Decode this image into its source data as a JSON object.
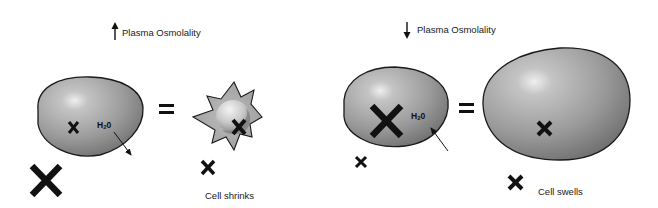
{
  "panels": [
    {
      "id": "left",
      "title": {
        "arrow": "up-arrow",
        "text": "Plasma Osmolality"
      },
      "cell_before": {
        "shape": "oval",
        "solvent_label": {
          "base": "H",
          "sub": "2",
          "tail": "0"
        },
        "water_flow": "out",
        "inner_solute_marker": "small",
        "outer_solute_marker": "large"
      },
      "equals": "=",
      "cell_after": {
        "shape": "crenated-star",
        "inner_solute_marker": "medium",
        "outer_solute_marker": "small"
      },
      "caption": "Cell shrinks"
    },
    {
      "id": "right",
      "title": {
        "arrow": "down-arrow",
        "text": "Plasma Osmolality"
      },
      "cell_before": {
        "shape": "oval",
        "solvent_label": {
          "base": "H",
          "sub": "2",
          "tail": "0"
        },
        "water_flow": "in",
        "inner_solute_marker": "large",
        "outer_solute_marker": "small"
      },
      "equals": "=",
      "cell_after": {
        "shape": "large-oval",
        "inner_solute_marker": "small",
        "outer_solute_marker": "small"
      },
      "caption": "Cell swells"
    }
  ],
  "colors": {
    "cell_fill_light": "#d8d8d8",
    "cell_fill_dark": "#6e6e6e",
    "outline": "#1a1a1a",
    "marker": "#111111",
    "background": "#ffffff"
  }
}
